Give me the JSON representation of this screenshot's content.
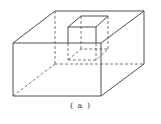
{
  "figure": {
    "caption": "( a )",
    "colors": {
      "line": "#3a3a3a",
      "background": "#ffffff"
    }
  },
  "geometry": {
    "big_box": {
      "front_top_left": [
        13,
        43
      ],
      "front_top_right": [
        101,
        43
      ],
      "front_bottom_left": [
        13,
        96
      ],
      "front_bottom_right": [
        101,
        96
      ],
      "back_top_left": [
        55,
        11
      ],
      "back_top_right": [
        144,
        11
      ],
      "back_bottom_left": [
        55,
        64
      ],
      "back_bottom_right": [
        144,
        64
      ]
    },
    "small_cube": {
      "top_front_left": [
        68,
        27
      ],
      "top_front_right": [
        96,
        27
      ],
      "top_back_left": [
        81,
        16
      ],
      "top_back_right": [
        108,
        16
      ],
      "bottom_front_left": [
        68,
        60
      ],
      "bottom_front_right": [
        96,
        60
      ],
      "bottom_back_left": [
        81,
        49
      ],
      "bottom_back_right": [
        108,
        49
      ]
    }
  }
}
